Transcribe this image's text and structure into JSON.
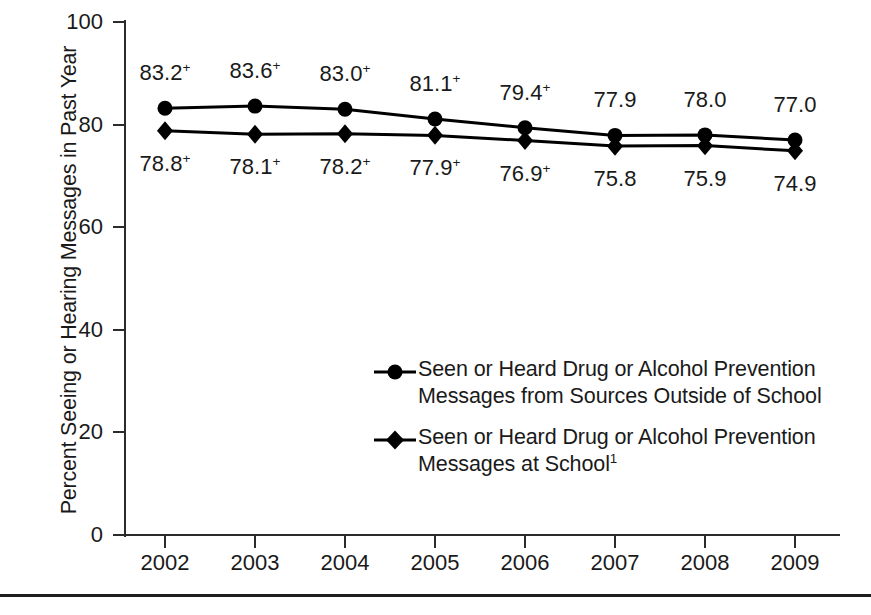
{
  "chart_data": {
    "type": "line",
    "title": "",
    "xlabel": "",
    "ylabel": "Percent Seeing or Hearing Messages in Past Year",
    "categories": [
      "2002",
      "2003",
      "2004",
      "2005",
      "2006",
      "2007",
      "2008",
      "2009"
    ],
    "x": [
      2002,
      2003,
      2004,
      2005,
      2006,
      2007,
      2008,
      2009
    ],
    "xlim": [
      2002,
      2009
    ],
    "ylim": [
      0,
      100
    ],
    "yticks": [
      "0",
      "20",
      "40",
      "60",
      "80",
      "100"
    ],
    "ytick_values": [
      0,
      20,
      40,
      60,
      80,
      100
    ],
    "grid": false,
    "legend_position": "inside-center",
    "series": [
      {
        "name": "Seen or Heard Drug or Alcohol Prevention\nMessages from Sources Outside of School",
        "marker": "circle",
        "color": "#000000",
        "values": [
          83.2,
          83.6,
          83.0,
          81.1,
          79.4,
          77.9,
          78.0,
          77.0
        ],
        "labels": [
          "83.2",
          "83.6",
          "83.0",
          "81.1",
          "79.4",
          "77.9",
          "78.0",
          "77.0"
        ],
        "significance_marks": [
          "+",
          "+",
          "+",
          "+",
          "+",
          "",
          "",
          ""
        ]
      },
      {
        "name": "Seen or Heard Drug or Alcohol Prevention\nMessages at School",
        "name_footnote": "1",
        "marker": "diamond",
        "color": "#000000",
        "values": [
          78.8,
          78.1,
          78.2,
          77.9,
          76.9,
          75.8,
          75.9,
          74.9
        ],
        "labels": [
          "78.8",
          "78.1",
          "78.2",
          "77.9",
          "76.9",
          "75.8",
          "75.9",
          "74.9"
        ],
        "significance_marks": [
          "+",
          "+",
          "+",
          "+",
          "+",
          "",
          "",
          ""
        ]
      }
    ]
  },
  "legend": [
    {
      "marker": "circle-line-marker",
      "label": "Seen or Heard Drug or Alcohol Prevention\nMessages from Sources Outside of School"
    },
    {
      "marker": "diamond-line-marker",
      "label": "Seen or Heard Drug or Alcohol Prevention\nMessages at School",
      "footnote": "1"
    }
  ],
  "colors": {
    "axis": "#2b2b2b",
    "series": "#000000",
    "background": "#ffffff",
    "rule": "#1f1f1f"
  }
}
